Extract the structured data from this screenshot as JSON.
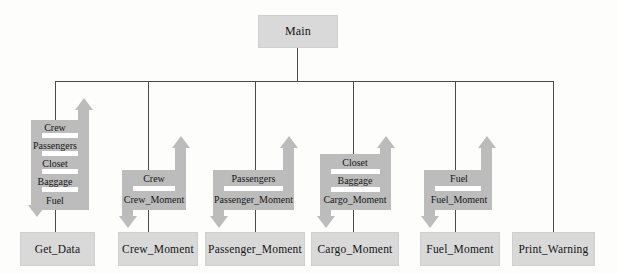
{
  "diagram": {
    "title": "Main",
    "type": "structure-chart",
    "colors": {
      "module_fill": "#d9d9d9",
      "module_border": "#cfcfcf",
      "coupling_arrow": "#bcbcbc",
      "connector_line": "#4a4a4a",
      "background": "#fdfdfc",
      "text": "#141414"
    },
    "root": {
      "label": "Main"
    },
    "modules": [
      {
        "id": "get_data",
        "label": "Get_Data"
      },
      {
        "id": "crew_moment",
        "label": "Crew_Moment"
      },
      {
        "id": "passenger_moment",
        "label": "Passenger_Moment"
      },
      {
        "id": "cargo_moment",
        "label": "Cargo_Moment"
      },
      {
        "id": "fuel_moment",
        "label": "Fuel_Moment"
      },
      {
        "id": "print_warning",
        "label": "Print_Warning"
      }
    ],
    "couplings": [
      {
        "module": "get_data",
        "direction": "out",
        "data": [
          "Crew",
          "Passengers",
          "Closet",
          "Baggage",
          "Fuel"
        ]
      },
      {
        "module": "crew_moment",
        "direction": "in-out",
        "in": [
          "Crew"
        ],
        "out": [
          "Crew_Moment"
        ]
      },
      {
        "module": "passenger_moment",
        "direction": "in-out",
        "in": [
          "Passengers"
        ],
        "out": [
          "Passenger_Moment"
        ]
      },
      {
        "module": "cargo_moment",
        "direction": "in-out",
        "in": [
          "Closet",
          "Baggage"
        ],
        "out": [
          "Cargo_Moment"
        ]
      },
      {
        "module": "fuel_moment",
        "direction": "in-out",
        "in": [
          "Fuel"
        ],
        "out": [
          "Fuel_Moment"
        ]
      },
      {
        "module": "print_warning",
        "direction": "none",
        "in": [],
        "out": []
      }
    ],
    "labels": {
      "main": "Main",
      "get_data": "Get_Data",
      "crew_moment": "Crew_Moment",
      "passenger_moment": "Passenger_Moment",
      "cargo_moment": "Cargo_Moment",
      "fuel_moment": "Fuel_Moment",
      "print_warning": "Print_Warning",
      "crew": "Crew",
      "passengers": "Passengers",
      "closet": "Closet",
      "baggage": "Baggage",
      "fuel": "Fuel",
      "crew_moment_data": "Crew_Moment",
      "passenger_moment_data": "Passenger_Moment",
      "cargo_moment_data": "Cargo_Moment",
      "fuel_moment_data": "Fuel_Moment"
    }
  }
}
